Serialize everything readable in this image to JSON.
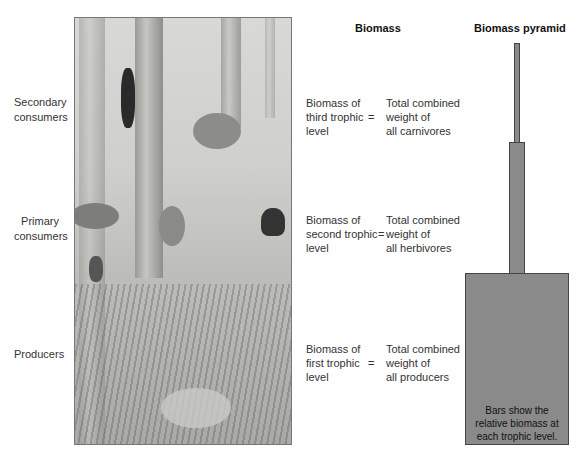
{
  "levels": [
    {
      "label": "Secondary consumers",
      "line1": "Secondary",
      "line2": "consumers"
    },
    {
      "label": "Primary consumers",
      "line1": "Primary",
      "line2": "consumers"
    },
    {
      "label": "Producers",
      "line1": "Producers",
      "line2": ""
    }
  ],
  "headers": {
    "biomass": "Biomass",
    "pyramid": "Biomass pyramid"
  },
  "biomass_rows": [
    {
      "left": [
        "Biomass of",
        "third trophic",
        "level"
      ],
      "eq": "=",
      "right": [
        "Total combined",
        "weight of",
        "all carnivores"
      ]
    },
    {
      "left": [
        "Biomass of",
        "second trophic",
        "level"
      ],
      "eq": "=",
      "right": [
        "Total combined",
        "weight of",
        "all herbivores"
      ]
    },
    {
      "left": [
        "Biomass of",
        "first trophic",
        "level"
      ],
      "eq": "=",
      "right": [
        "Total combined",
        "weight of",
        "all producers"
      ]
    }
  ],
  "pyramid": {
    "note": [
      "Bars show the",
      "relative biomass at",
      "each trophic level."
    ],
    "bar_color": "#8a8a8a",
    "border_color": "#444444"
  },
  "scene": {
    "description": "Forest illustration with woodpecker, fox, rabbit, squirrel, chipmunk, butterfly, and ground plants"
  }
}
